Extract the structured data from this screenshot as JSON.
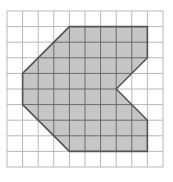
{
  "diagram": {
    "grid": {
      "cols": 10,
      "rows": 10,
      "origin_px": [
        7,
        11
      ],
      "cell_px": 15.6,
      "line_color": "#b8b8b8"
    },
    "polygon": {
      "vertices_grid": [
        [
          4,
          1
        ],
        [
          9,
          1
        ],
        [
          9,
          3
        ],
        [
          7,
          5
        ],
        [
          9,
          7
        ],
        [
          9,
          9
        ],
        [
          4,
          9
        ],
        [
          1,
          6
        ],
        [
          1,
          4
        ]
      ],
      "fill_color": "#c6c6c6",
      "stroke_color": "#555555",
      "inner_grid_color": "#6a6a6a"
    }
  }
}
